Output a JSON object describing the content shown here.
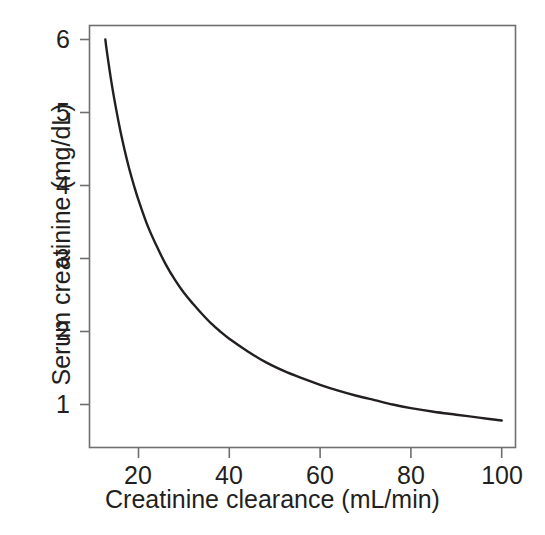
{
  "chart_data": {
    "type": "line",
    "title": "",
    "subtitle": "",
    "xlabel": "Creatinine clearance (mL/min)",
    "ylabel": "Serum creatinine (mg/dL)",
    "xlim": [
      12.7,
      101.5
    ],
    "ylim": [
      0.68,
      6.15
    ],
    "grid": false,
    "legend": null,
    "xticks": [
      20,
      40,
      60,
      80,
      100
    ],
    "xtick_labels": [
      "20",
      "40",
      "60",
      "80",
      "100"
    ],
    "yticks": [
      1,
      2,
      3,
      4,
      5,
      6
    ],
    "ytick_labels": [
      "1",
      "2",
      "3",
      "4",
      "5",
      "6"
    ],
    "line_color": "#231f20",
    "line_width": 2.4,
    "frame_color": "#6f6f6f",
    "annotations": [],
    "series": [
      {
        "name": "Serum creatinine vs creatinine clearance",
        "x": [
          12.7,
          13,
          14,
          15,
          16,
          17,
          18,
          19,
          20,
          22,
          24,
          26,
          28,
          30,
          32,
          34,
          36,
          38,
          40,
          44,
          48,
          52,
          56,
          60,
          64,
          68,
          72,
          76,
          80,
          85,
          90,
          95,
          100
        ],
        "y": [
          6.0,
          5.85,
          5.43,
          5.07,
          4.75,
          4.47,
          4.22,
          4.0,
          3.8,
          3.45,
          3.17,
          2.92,
          2.71,
          2.53,
          2.38,
          2.24,
          2.11,
          2.0,
          1.9,
          1.73,
          1.58,
          1.46,
          1.36,
          1.27,
          1.19,
          1.12,
          1.06,
          1.0,
          0.95,
          0.9,
          0.86,
          0.82,
          0.78
        ]
      }
    ]
  },
  "axes": {
    "y_title": "Serum creatinine (mg/dL)",
    "x_title": "Creatinine clearance (mL/min)",
    "x_tick_labels": [
      "20",
      "40",
      "60",
      "80",
      "100"
    ],
    "y_tick_labels": [
      "1",
      "2",
      "3",
      "4",
      "5",
      "6"
    ]
  }
}
